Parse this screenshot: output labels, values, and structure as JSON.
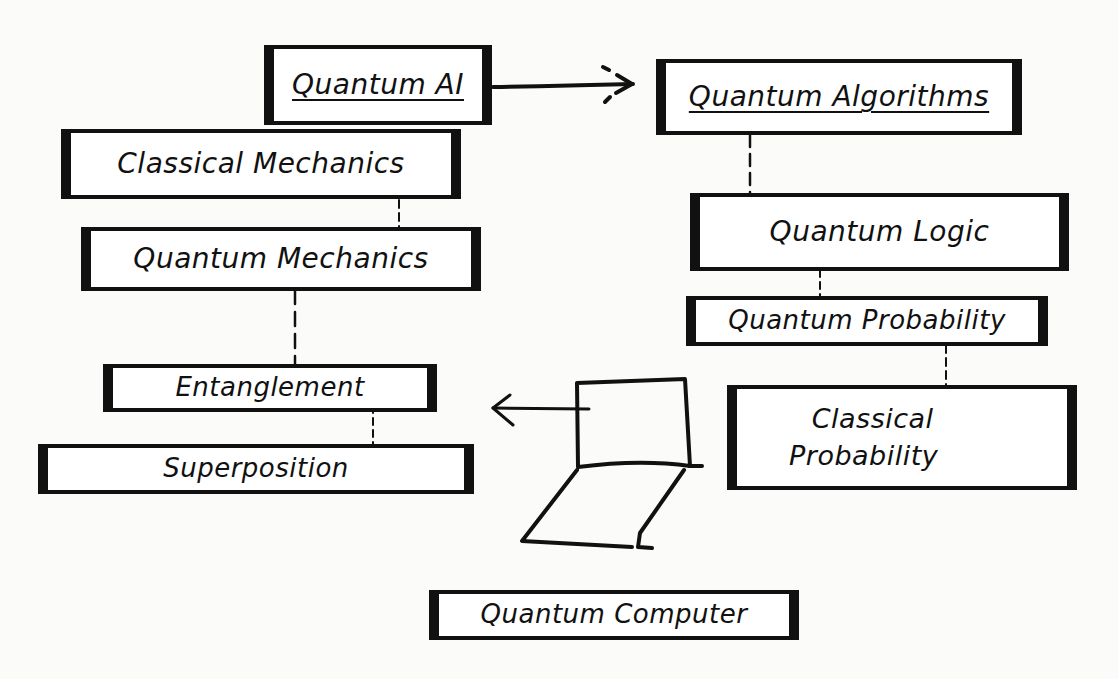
{
  "diagram": {
    "nodes": [
      {
        "id": "quantum-ai",
        "label": "Quantum AI",
        "underlined": true
      },
      {
        "id": "quantum-algorithms",
        "label": "Quantum Algorithms",
        "underlined": true
      },
      {
        "id": "classical-mechanics",
        "label": "Classical Mechanics"
      },
      {
        "id": "quantum-mechanics",
        "label": "Quantum Mechanics"
      },
      {
        "id": "quantum-logic",
        "label": "Quantum Logic"
      },
      {
        "id": "quantum-probability",
        "label": "Quantum Probability"
      },
      {
        "id": "entanglement",
        "label": "Entanglement"
      },
      {
        "id": "classical-probability",
        "label": "Classical Probability",
        "lines": [
          "Classical",
          "Probability"
        ]
      },
      {
        "id": "superposition",
        "label": "Superposition"
      },
      {
        "id": "quantum-computer",
        "label": "Quantum Computer"
      }
    ],
    "edges": [
      {
        "from": "quantum-ai",
        "to": "quantum-algorithms",
        "style": "arrow"
      },
      {
        "from": "classical-mechanics",
        "to": "quantum-mechanics",
        "style": "dashed"
      },
      {
        "from": "quantum-mechanics",
        "to": "entanglement",
        "style": "dashed"
      },
      {
        "from": "entanglement",
        "to": "superposition",
        "style": "dashed"
      },
      {
        "from": "quantum-algorithms",
        "to": "quantum-logic",
        "style": "dashed"
      },
      {
        "from": "quantum-logic",
        "to": "quantum-probability",
        "style": "dashed"
      },
      {
        "from": "quantum-probability",
        "to": "classical-probability",
        "style": "dashed"
      },
      {
        "from": "laptop-sketch",
        "to": "entanglement",
        "style": "arrow"
      }
    ],
    "icons": {
      "laptop": "laptop-icon"
    },
    "colors": {
      "ink": "#111111",
      "paper": "#fbfbf9",
      "box_fill": "#ffffff"
    }
  }
}
